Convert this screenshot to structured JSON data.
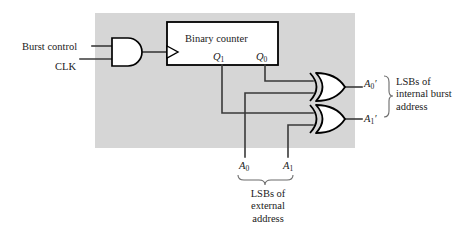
{
  "figure": {
    "type": "digital-logic-schematic",
    "panel": {
      "fill": "#d6d6d6",
      "x": 95,
      "y": 13,
      "width": 260,
      "height": 135
    },
    "colors": {
      "panel_gray": "#d6d6d6",
      "wire": "#3a3a3a",
      "outline": "#000000",
      "box_fill": "#ffffff",
      "text": "#1a1a1a",
      "page_background": "#ffffff"
    },
    "inputs": [
      {
        "name": "burst-control",
        "label": "Burst control"
      },
      {
        "name": "clk",
        "label": "CLK"
      }
    ],
    "gates": [
      {
        "name": "and-gate",
        "type": "AND",
        "inputs": [
          "Burst control",
          "CLK"
        ],
        "output_to": "Binary counter clock"
      },
      {
        "name": "xor-gate-0",
        "type": "XOR",
        "inputs": [
          "Q0",
          "A0"
        ],
        "output": "A0'"
      },
      {
        "name": "xor-gate-1",
        "type": "XOR",
        "inputs": [
          "Q1",
          "A1"
        ],
        "output": "A1'"
      }
    ],
    "counter": {
      "label": "Binary counter",
      "outputs": [
        {
          "base": "Q",
          "sub": "1"
        },
        {
          "base": "Q",
          "sub": "0"
        }
      ]
    },
    "external_address_bits": [
      {
        "base": "A",
        "sub": "0"
      },
      {
        "base": "A",
        "sub": "1"
      }
    ],
    "internal_address_bits": [
      {
        "base": "A",
        "sub": "0",
        "prime": "′"
      },
      {
        "base": "A",
        "sub": "1",
        "prime": "′"
      }
    ],
    "annotations": {
      "right_brace_text": [
        "LSBs of",
        "internal burst",
        "address"
      ],
      "bottom_brace_text": [
        "LSBs of",
        "external",
        "address"
      ]
    }
  }
}
